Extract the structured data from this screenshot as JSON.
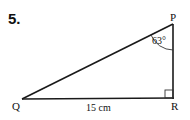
{
  "question_number": "5.",
  "vertices": {
    "P": {
      "label": "P",
      "x": 173,
      "y": 25
    },
    "Q": {
      "label": "Q",
      "x": 22,
      "y": 99
    },
    "R": {
      "label": "R",
      "x": 173,
      "y": 98
    }
  },
  "angle_label": "63°",
  "side_label": "15 cm",
  "right_angle_at": "R"
}
